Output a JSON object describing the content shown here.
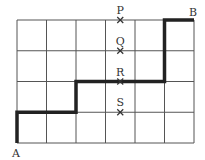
{
  "diagram": {
    "grid": {
      "cols": 6,
      "rows": 4,
      "left": 17,
      "top": 20,
      "cell_w": 29.5,
      "cell_h": 30.75,
      "line_color": "#555555"
    },
    "path": {
      "color": "#222222",
      "points": [
        [
          0,
          0
        ],
        [
          0,
          1
        ],
        [
          2,
          1
        ],
        [
          2,
          2
        ],
        [
          5,
          2
        ],
        [
          5,
          4
        ],
        [
          6,
          4
        ]
      ]
    },
    "labels": {
      "start": "A",
      "end": "B"
    },
    "markers": [
      {
        "label": "P",
        "x": 3.5,
        "y": 4
      },
      {
        "label": "Q",
        "x": 3.5,
        "y": 3
      },
      {
        "label": "R",
        "x": 3.5,
        "y": 2
      },
      {
        "label": "S",
        "x": 3.5,
        "y": 1
      }
    ]
  }
}
